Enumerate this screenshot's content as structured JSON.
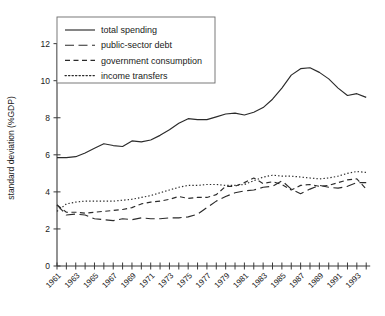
{
  "chart_data": {
    "type": "line",
    "title": "",
    "xlabel": "",
    "ylabel": "standard deviation (%GDP)",
    "xlim": [
      1961,
      1994
    ],
    "ylim": [
      0,
      12
    ],
    "yticks": [
      0,
      2,
      4,
      6,
      8,
      10,
      12
    ],
    "ytick_labels": [
      "0",
      "2",
      "4",
      "6",
      "8",
      "10",
      "12"
    ],
    "grid": false,
    "legend_position": "top-left-inside",
    "x": [
      1961,
      1962,
      1963,
      1964,
      1965,
      1966,
      1967,
      1968,
      1969,
      1970,
      1971,
      1972,
      1973,
      1974,
      1975,
      1976,
      1977,
      1978,
      1979,
      1980,
      1981,
      1982,
      1983,
      1984,
      1985,
      1986,
      1987,
      1988,
      1989,
      1990,
      1991,
      1992,
      1993,
      1994
    ],
    "xtick_labels": [
      "1961",
      "",
      "1963",
      "",
      "1965",
      "",
      "1967",
      "",
      "1969",
      "",
      "1971",
      "",
      "1973",
      "",
      "1975",
      "",
      "1977",
      "",
      "1979",
      "",
      "1981",
      "",
      "1983",
      "",
      "1985",
      "",
      "1987",
      "",
      "1989",
      "",
      "1991",
      "",
      "1993",
      ""
    ],
    "xtick_labels_shown": [
      "1961",
      "1963",
      "1965",
      "1967",
      "1969",
      "1971",
      "1973",
      "1975",
      "1977",
      "1979",
      "1981",
      "1983",
      "1985",
      "1987",
      "1989",
      "1991",
      "1993"
    ],
    "series": [
      {
        "name": "total spending",
        "style": "solid",
        "values": [
          5.85,
          5.85,
          5.9,
          6.1,
          6.35,
          6.6,
          6.5,
          6.45,
          6.75,
          6.7,
          6.8,
          7.05,
          7.35,
          7.7,
          7.95,
          7.9,
          7.9,
          8.05,
          8.2,
          8.25,
          8.15,
          8.3,
          8.55,
          9.0,
          9.6,
          10.3,
          10.65,
          10.7,
          10.45,
          10.1,
          9.6,
          9.2,
          9.3,
          9.1
        ]
      },
      {
        "name": "public-sector debt",
        "style": "longdash",
        "values": [
          3.3,
          2.75,
          2.8,
          2.75,
          2.55,
          2.5,
          2.45,
          2.55,
          2.5,
          2.6,
          2.55,
          2.55,
          2.6,
          2.6,
          2.65,
          2.8,
          3.15,
          3.5,
          3.75,
          3.95,
          4.05,
          4.1,
          4.25,
          4.3,
          4.6,
          4.15,
          3.9,
          4.15,
          4.35,
          4.25,
          4.2,
          4.3,
          4.5,
          4.5
        ]
      },
      {
        "name": "government consumption",
        "style": "dash",
        "values": [
          3.3,
          2.9,
          2.9,
          2.85,
          2.9,
          2.95,
          3.0,
          3.05,
          3.15,
          3.35,
          3.45,
          3.5,
          3.6,
          3.75,
          3.65,
          3.7,
          3.7,
          3.85,
          4.3,
          4.3,
          4.5,
          4.75,
          4.45,
          4.55,
          4.4,
          4.1,
          4.35,
          4.4,
          4.3,
          4.35,
          4.5,
          4.65,
          4.7,
          4.15
        ]
      },
      {
        "name": "income transfers",
        "style": "dotted",
        "values": [
          2.95,
          3.35,
          3.45,
          3.5,
          3.5,
          3.5,
          3.5,
          3.55,
          3.6,
          3.7,
          3.8,
          3.95,
          4.1,
          4.25,
          4.35,
          4.35,
          4.4,
          4.4,
          4.35,
          4.35,
          4.4,
          4.6,
          4.8,
          4.9,
          4.85,
          4.85,
          4.8,
          4.75,
          4.7,
          4.75,
          4.85,
          5.0,
          5.1,
          5.05
        ]
      }
    ]
  },
  "legend": {
    "items": [
      {
        "label": "total spending",
        "style": "solid"
      },
      {
        "label": "public-sector debt",
        "style": "longdash"
      },
      {
        "label": "government consumption",
        "style": "dash"
      },
      {
        "label": "income transfers",
        "style": "dotted"
      }
    ]
  },
  "colors": {
    "line": "#2b2b2b",
    "axis": "#3a3a3a",
    "text": "#1a1a1a",
    "background": "#ffffff",
    "legend_border": "#6a6a6a"
  }
}
